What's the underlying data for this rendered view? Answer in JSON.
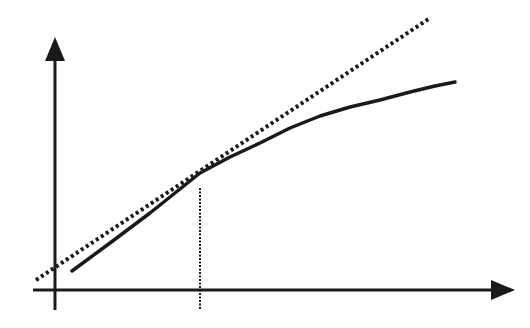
{
  "diagram": {
    "type": "tangent-line-approximation",
    "background": "#ffffff",
    "ink_color": "#1a1a1a",
    "axes": {
      "y_axis": {
        "x": 55,
        "top": 37,
        "bottom": 310,
        "arrow": "up"
      },
      "x_axis": {
        "y": 290,
        "left": 33,
        "right": 515,
        "arrow": "right"
      }
    },
    "tangent_line": {
      "style": "dotted",
      "start": [
        36,
        280
      ],
      "end": [
        430,
        18
      ]
    },
    "curve": {
      "style": "solid",
      "points": [
        [
          72,
          271
        ],
        [
          110,
          243
        ],
        [
          150,
          213
        ],
        [
          185,
          185
        ],
        [
          200,
          173
        ],
        [
          230,
          157
        ],
        [
          260,
          143
        ],
        [
          290,
          128
        ],
        [
          320,
          116
        ],
        [
          350,
          107
        ],
        [
          380,
          100
        ],
        [
          410,
          92
        ],
        [
          435,
          86
        ],
        [
          455,
          82
        ]
      ]
    },
    "tangent_point_marker": {
      "style": "dotted",
      "x": 200,
      "top": 188,
      "bottom": 310
    }
  }
}
